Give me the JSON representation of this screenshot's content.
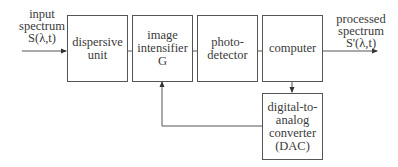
{
  "diagram": {
    "type": "block-diagram",
    "input_label": "input\nspectrum\nS(λ,t)",
    "output_label": "processed\nspectrum\nS'(λ,t)",
    "blocks": [
      {
        "id": "dispersive",
        "label": "dispersive\nunit"
      },
      {
        "id": "intensifier",
        "label": "image\nintensifier\nG"
      },
      {
        "id": "photodetector",
        "label": "photo-\ndetector"
      },
      {
        "id": "computer",
        "label": "computer"
      },
      {
        "id": "dac",
        "label": "digital-to-\nanalog\nconverter\n(DAC)"
      }
    ],
    "connections": [
      {
        "from": "input",
        "to": "dispersive",
        "arrow": true
      },
      {
        "from": "dispersive",
        "to": "intensifier",
        "arrow": false
      },
      {
        "from": "intensifier",
        "to": "photodetector",
        "arrow": false
      },
      {
        "from": "photodetector",
        "to": "computer",
        "arrow": false
      },
      {
        "from": "computer",
        "to": "output",
        "arrow": true
      },
      {
        "from": "computer",
        "to": "dac",
        "arrow": true
      },
      {
        "from": "dac",
        "to": "intensifier",
        "arrow": true
      }
    ],
    "line_color": "#555555"
  }
}
